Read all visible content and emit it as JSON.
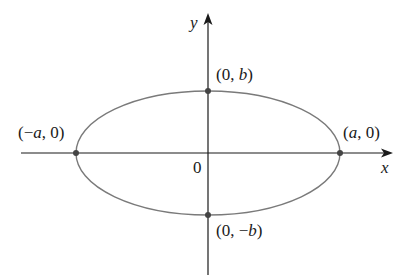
{
  "diagram": {
    "type": "ellipse-on-axes",
    "colors": {
      "axis": "#1a1a1a",
      "ellipse": "#7a7a7a",
      "point": "#444444"
    },
    "axes": {
      "x_label": "x",
      "y_label": "y",
      "origin_label": "0"
    },
    "ellipse": {
      "center": [
        208,
        153
      ],
      "rx": 132,
      "ry": 62
    },
    "points": [
      {
        "name": "right-vertex",
        "label_pre": "(",
        "label_var": "a",
        "label_post": ", 0)"
      },
      {
        "name": "left-vertex",
        "label_pre": "(−",
        "label_var": "a",
        "label_post": ", 0)"
      },
      {
        "name": "top-vertex",
        "label_pre": "(0, ",
        "label_var": "b",
        "label_post": ")"
      },
      {
        "name": "bottom-vertex",
        "label_pre": "(0, −",
        "label_var": "b",
        "label_post": ")"
      }
    ]
  }
}
